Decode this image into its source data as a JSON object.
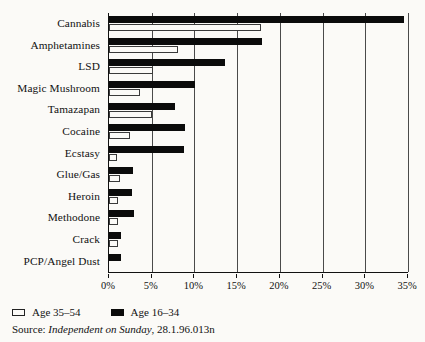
{
  "chart_data": {
    "type": "bar",
    "orientation": "horizontal",
    "title": "",
    "xlabel": "",
    "ylabel": "",
    "xlim": [
      0,
      35
    ],
    "grid": true,
    "grid_axis": "x",
    "legend_position": "bottom-left",
    "categories": [
      "Cannabis",
      "Amphetamines",
      "LSD",
      "Magic Mushroom",
      "Tamazapan",
      "Cocaine",
      "Ecstasy",
      "Glue/Gas",
      "Heroin",
      "Methodone",
      "Crack",
      "PCP/Angel Dust"
    ],
    "series": [
      {
        "name": "Age 16–34",
        "color": "#0b0b0b",
        "values": [
          34.5,
          17.9,
          13.6,
          10.1,
          7.7,
          8.9,
          8.8,
          2.8,
          2.7,
          2.9,
          1.4,
          1.4
        ]
      },
      {
        "name": "Age 35–54",
        "color": "#ffffff",
        "values": [
          17.8,
          8.1,
          5.2,
          3.6,
          5.0,
          2.4,
          0.9,
          1.3,
          1.0,
          1.1,
          1.0,
          0.0
        ]
      }
    ],
    "xticks": [
      0,
      5,
      10,
      15,
      20,
      25,
      30,
      35
    ],
    "xtick_labels": [
      "0%",
      "5%",
      "10%",
      "15%",
      "20%",
      "25%",
      "30%",
      "35%"
    ]
  },
  "legend": {
    "items": [
      {
        "label": "Age 35–54",
        "style": "outline"
      },
      {
        "label": "Age 16–34",
        "style": "filled"
      }
    ]
  },
  "source": {
    "prefix": "Source:",
    "publication": "Independent on Sunday",
    "suffix": ", 28.1.96.013n"
  }
}
